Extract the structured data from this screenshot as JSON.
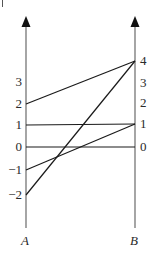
{
  "diagram": {
    "type": "parallel-axis mapping diagram",
    "stroke_color": "#1a1a1a",
    "text_color": "#2a2a2a",
    "axes": [
      {
        "id": "A",
        "label": "A",
        "x": 26,
        "ticks": [
          {
            "label": "3",
            "value": 3,
            "y": 82
          },
          {
            "label": "2",
            "value": 2,
            "y": 104
          },
          {
            "label": "1",
            "value": 1,
            "y": 125
          },
          {
            "label": "0",
            "value": 0,
            "y": 147
          },
          {
            "label": "−1",
            "value": -1,
            "y": 170
          },
          {
            "label": "−2",
            "value": -2,
            "y": 195
          }
        ]
      },
      {
        "id": "B",
        "label": "B",
        "x": 135,
        "ticks": [
          {
            "label": "4",
            "value": 4,
            "y": 61
          },
          {
            "label": "3",
            "value": 3,
            "y": 83
          },
          {
            "label": "2",
            "value": 2,
            "y": 103
          },
          {
            "label": "1",
            "value": 1,
            "y": 124
          },
          {
            "label": "0",
            "value": 0,
            "y": 147
          }
        ]
      }
    ],
    "mappings": [
      {
        "from": 2,
        "to": 4
      },
      {
        "from": -2,
        "to": 4
      },
      {
        "from": 1,
        "to": 1
      },
      {
        "from": 0,
        "to": 0
      },
      {
        "from": -1,
        "to": 1
      }
    ]
  }
}
